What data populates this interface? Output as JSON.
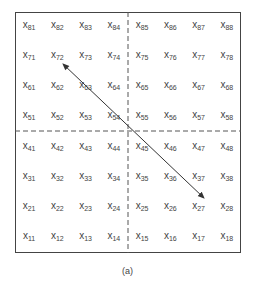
{
  "diagram": {
    "variable_symbol": "x",
    "rows": [
      [
        "81",
        "82",
        "83",
        "84",
        "85",
        "86",
        "87",
        "88"
      ],
      [
        "71",
        "72",
        "73",
        "74",
        "75",
        "76",
        "77",
        "78"
      ],
      [
        "61",
        "62",
        "63",
        "64",
        "65",
        "66",
        "67",
        "68"
      ],
      [
        "51",
        "52",
        "53",
        "54",
        "55",
        "56",
        "57",
        "58"
      ],
      [
        "41",
        "42",
        "43",
        "44",
        "45",
        "46",
        "47",
        "48"
      ],
      [
        "31",
        "32",
        "33",
        "34",
        "35",
        "36",
        "37",
        "38"
      ],
      [
        "21",
        "22",
        "23",
        "24",
        "25",
        "26",
        "27",
        "28"
      ],
      [
        "11",
        "12",
        "13",
        "14",
        "15",
        "16",
        "17",
        "18"
      ]
    ],
    "dividers": [
      "vertical-center-dashed",
      "horizontal-center-dashed"
    ],
    "arrow": {
      "from": "x72",
      "to": "x27",
      "type": "double-headed"
    },
    "caption": "(a)",
    "colors": {
      "line": "#444444",
      "text": "#444444"
    }
  }
}
